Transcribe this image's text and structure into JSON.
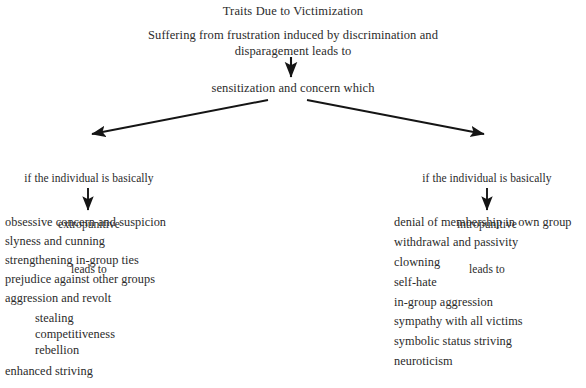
{
  "diagram": {
    "title": "Traits Due to Victimization",
    "premise": {
      "line1": "Suffering from frustration induced by discrimination and",
      "line2": "disparagement leads to"
    },
    "central_node": "sensitization and concern which",
    "branches": {
      "left": {
        "label_line1": "if the individual is basically",
        "label_line2": "extropunitive",
        "label_line3": "leads to",
        "traits": [
          "obsessive concern and suspicion",
          "slyness and cunning",
          "strengthening in-group ties",
          "prejudice against other groups",
          "aggression and revolt"
        ],
        "sub_traits": [
          "stealing",
          "competitiveness",
          "rebellion"
        ],
        "trailing_traits": [
          "enhanced striving"
        ]
      },
      "right": {
        "label_line1": "if the individual is basically",
        "label_line2": "intropunitive",
        "label_line3": "leads to",
        "traits": [
          "denial of membership in own group",
          "withdrawal and passivity",
          "clowning",
          "self-hate",
          "in-group aggression",
          "sympathy with all victims",
          "symbolic status striving",
          "neuroticism"
        ]
      }
    },
    "colors": {
      "background": "#ffffff",
      "text": "#2b2b2b",
      "arrow": "#151515"
    }
  }
}
